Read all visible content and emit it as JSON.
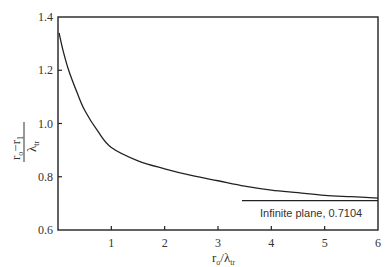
{
  "chart_data": {
    "type": "line",
    "title": "",
    "xlabel": "r_o/λ_tr",
    "ylabel": "(r_o − r_1)/λ_tr",
    "xlim": [
      0,
      6
    ],
    "ylim": [
      0.6,
      1.4
    ],
    "grid": false,
    "xticks": [
      1,
      2,
      3,
      4,
      5,
      6
    ],
    "xtick_labels": [
      "1",
      "2",
      "3",
      "4",
      "5",
      "6"
    ],
    "yticks": [
      0.6,
      0.8,
      1.0,
      1.2,
      1.4
    ],
    "ytick_labels": [
      "0.6",
      "0.8",
      "1.0",
      "1.2",
      "1.4"
    ],
    "series": [
      {
        "name": "extrapolation distance",
        "x": [
          0.02,
          0.1,
          0.2,
          0.35,
          0.5,
          0.75,
          1.0,
          1.5,
          2.0,
          2.5,
          3.0,
          3.5,
          4.0,
          4.5,
          5.0,
          5.5,
          6.0
        ],
        "y": [
          1.34,
          1.27,
          1.2,
          1.12,
          1.05,
          0.97,
          0.91,
          0.86,
          0.83,
          0.805,
          0.785,
          0.765,
          0.75,
          0.74,
          0.73,
          0.725,
          0.72
        ]
      }
    ],
    "annotations": [
      {
        "text": "Infinite plane, 0.7104",
        "type": "hline",
        "y": 0.7104,
        "x_start": 3.45,
        "x_end": 6
      }
    ],
    "axis_labels": {
      "x_main": "r",
      "x_sub_num": "o",
      "x_den": "λ",
      "x_den_sub": "tr",
      "y_num": "r",
      "y_num_sub1": "o",
      "y_minus": "−",
      "y_num2": "r",
      "y_num_sub2": "1",
      "y_den": "λ",
      "y_den_sub": "tr"
    },
    "legend": "none"
  }
}
